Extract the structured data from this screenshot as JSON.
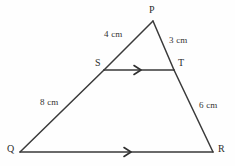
{
  "figure": {
    "kind": "triangle-with-parallel-transversal",
    "background_color": "#fefefe",
    "stroke_color": "#3a3a3a",
    "text_color": "#2c2c2c"
  },
  "vertices": [
    {
      "name": "P",
      "label": "P",
      "x": 153,
      "y": 21,
      "label_x": 149,
      "label_y": 5
    },
    {
      "name": "Q",
      "label": "Q",
      "x": 20,
      "y": 152,
      "label_x": 7,
      "label_y": 144
    },
    {
      "name": "R",
      "label": "R",
      "x": 213,
      "y": 152,
      "label_x": 218,
      "label_y": 144
    },
    {
      "name": "S",
      "label": "S",
      "x": 104,
      "y": 70,
      "label_x": 95,
      "label_y": 58
    },
    {
      "name": "T",
      "label": "T",
      "x": 174,
      "y": 70,
      "label_x": 178,
      "label_y": 58
    }
  ],
  "segments": [
    {
      "name": "PS",
      "from": "P",
      "to": "S"
    },
    {
      "name": "SQ",
      "from": "S",
      "to": "Q"
    },
    {
      "name": "PT",
      "from": "P",
      "to": "T"
    },
    {
      "name": "TR",
      "from": "T",
      "to": "R"
    },
    {
      "name": "ST",
      "from": "S",
      "to": "T",
      "parallel_mark": true
    },
    {
      "name": "QR",
      "from": "Q",
      "to": "R",
      "parallel_mark": true
    }
  ],
  "measurements": [
    {
      "name": "PS-length",
      "segment": "PS",
      "text": "4 cm",
      "x": 104,
      "y": 30
    },
    {
      "name": "PT-length",
      "segment": "PT",
      "text": "3 cm",
      "x": 169,
      "y": 36
    },
    {
      "name": "SQ-length",
      "segment": "SQ",
      "text": "8 cm",
      "x": 40,
      "y": 98
    },
    {
      "name": "TR-length",
      "segment": "TR",
      "text": "6 cm",
      "x": 199,
      "y": 101
    }
  ],
  "parallel_marks": [
    {
      "name": "st-parallel-arrow",
      "on": "ST",
      "x": 140,
      "y": 70,
      "direction": "right"
    },
    {
      "name": "qr-parallel-arrow",
      "on": "QR",
      "x": 130,
      "y": 152,
      "direction": "right"
    }
  ]
}
